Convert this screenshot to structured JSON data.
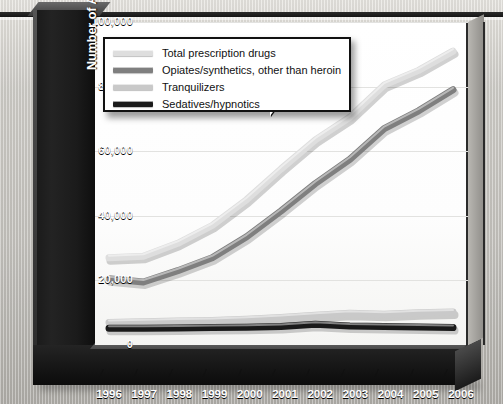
{
  "axis": {
    "y_title": "Number of Admissions to Rehabilitation Centers",
    "y_ticks": [
      "100,000",
      "80,000",
      "60,000",
      "40,000",
      "20,000",
      "0"
    ],
    "x_ticks": [
      "1996",
      "1997",
      "1998",
      "1999",
      "2000",
      "2001",
      "2002",
      "2003",
      "2004",
      "2005",
      "2006"
    ]
  },
  "legend": {
    "items": [
      {
        "label": "Total prescription drugs",
        "color": "#dedede"
      },
      {
        "label": "Opiates/synthetics, other than heroin",
        "color": "#7f7f7f"
      },
      {
        "label": "Tranquilizers",
        "color": "#c9c9c9"
      },
      {
        "label": "Sedatives/hypnotics",
        "color": "#1a1a1a"
      }
    ]
  },
  "chart_data": {
    "type": "line",
    "title": "",
    "xlabel": "",
    "ylabel": "Number of Admissions to Rehabilitation Centers",
    "x": [
      1996,
      1997,
      1998,
      1999,
      2000,
      2001,
      2002,
      2003,
      2004,
      2005,
      2006
    ],
    "categories": [
      "1996",
      "1997",
      "1998",
      "1999",
      "2000",
      "2001",
      "2002",
      "2003",
      "2004",
      "2005",
      "2006"
    ],
    "ylim": [
      0,
      100000
    ],
    "ytick_values": [
      0,
      20000,
      40000,
      60000,
      80000,
      100000
    ],
    "grid": true,
    "legend_position": "upper-left",
    "series": [
      {
        "name": "Total prescription drugs",
        "color": "#dedede",
        "values": [
          27000,
          27500,
          31500,
          37000,
          45000,
          54500,
          63500,
          70500,
          80500,
          85000,
          91000
        ]
      },
      {
        "name": "Opiates/synthetics, other than heroin",
        "color": "#7f7f7f",
        "values": [
          20500,
          19500,
          23000,
          27000,
          33500,
          41500,
          50000,
          57500,
          67000,
          72500,
          79000
        ]
      },
      {
        "name": "Tranquilizers",
        "color": "#c9c9c9",
        "values": [
          7000,
          7200,
          7400,
          7600,
          8000,
          8500,
          9200,
          9800,
          9500,
          10000,
          10200
        ]
      },
      {
        "name": "Sedatives/hypnotics",
        "color": "#1a1a1a",
        "values": [
          5200,
          5200,
          5300,
          5400,
          5500,
          5700,
          6400,
          5900,
          5700,
          5600,
          5400
        ]
      }
    ]
  }
}
